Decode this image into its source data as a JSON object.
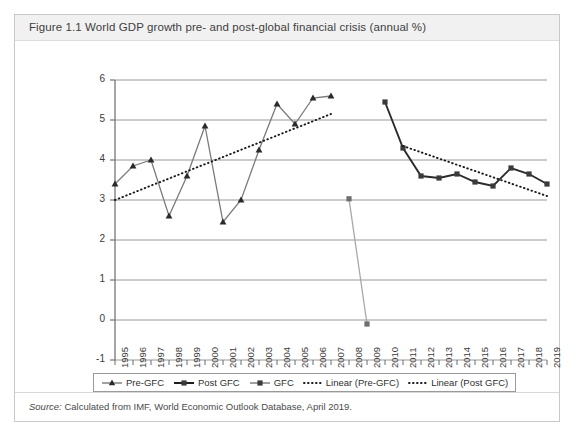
{
  "figure": {
    "title": "Figure 1.1  World GDP growth pre- and post-global financial crisis (annual %)",
    "source_label": "Source:",
    "source_text": "Calculated from IMF, World Economic Outlook Database, April 2019."
  },
  "legend": {
    "items": [
      {
        "label": "Pre-GFC",
        "marker": "triangle-marker",
        "style": "solid"
      },
      {
        "label": "Post GFC",
        "marker": "square-marker",
        "style": "solid"
      },
      {
        "label": "GFC",
        "marker": "square-marker",
        "style": "solid"
      },
      {
        "label": "Linear (Pre-GFC)",
        "marker": "dotted-line",
        "style": "dotted"
      },
      {
        "label": "Linear (Post GFC)",
        "marker": "dotted-line",
        "style": "dotted"
      }
    ]
  },
  "colors": {
    "series_pre_gfc": "#7a7a7a",
    "series_post_gfc": "#2b2b2b",
    "series_gfc": "#a8a8a8",
    "trend": "#1a1a1a",
    "gridline": "#8c8c8c",
    "axis": "#6b6b6b",
    "card_border": "#c9c9c9",
    "header_bg": "#f1f1f1"
  },
  "chart_data": {
    "type": "line",
    "title": "World GDP growth pre- and post-global financial crisis (annual %)",
    "xlabel": "",
    "ylabel": "",
    "ylim": [
      -1,
      6
    ],
    "yticks": [
      -1,
      0,
      1,
      2,
      3,
      4,
      5,
      6
    ],
    "grid": true,
    "legend_position": "bottom",
    "x": [
      1995,
      1996,
      1997,
      1998,
      1999,
      2000,
      2001,
      2002,
      2003,
      2004,
      2005,
      2006,
      2007,
      2008,
      2009,
      2010,
      2011,
      2012,
      2013,
      2014,
      2015,
      2016,
      2017,
      2018,
      2019
    ],
    "categories": [
      "1995",
      "1996",
      "1997",
      "1998",
      "1999",
      "2000",
      "2001",
      "2002",
      "2003",
      "2004",
      "2005",
      "2006",
      "2007",
      "2008",
      "2009",
      "2010",
      "2011",
      "2012",
      "2013",
      "2014",
      "2015",
      "2016",
      "2017",
      "2018",
      "2019"
    ],
    "series": [
      {
        "name": "Pre-GFC",
        "marker": "triangle",
        "color": "#7a7a7a",
        "points": [
          {
            "x": 1995,
            "y": 3.4
          },
          {
            "x": 1996,
            "y": 3.85
          },
          {
            "x": 1997,
            "y": 4.0
          },
          {
            "x": 1998,
            "y": 2.6
          },
          {
            "x": 1999,
            "y": 3.6
          },
          {
            "x": 2000,
            "y": 4.85
          },
          {
            "x": 2001,
            "y": 2.45
          },
          {
            "x": 2002,
            "y": 3.0
          },
          {
            "x": 2003,
            "y": 4.25
          },
          {
            "x": 2004,
            "y": 5.4
          },
          {
            "x": 2005,
            "y": 4.9
          },
          {
            "x": 2006,
            "y": 5.55
          },
          {
            "x": 2007,
            "y": 5.6
          }
        ]
      },
      {
        "name": "GFC",
        "marker": "square",
        "color": "#a8a8a8",
        "points": [
          {
            "x": 2008,
            "y": 3.03
          },
          {
            "x": 2009,
            "y": -0.1
          }
        ]
      },
      {
        "name": "Post GFC",
        "marker": "square",
        "color": "#2b2b2b",
        "points": [
          {
            "x": 2010,
            "y": 5.45
          },
          {
            "x": 2011,
            "y": 4.3
          },
          {
            "x": 2012,
            "y": 3.6
          },
          {
            "x": 2013,
            "y": 3.55
          },
          {
            "x": 2014,
            "y": 3.65
          },
          {
            "x": 2015,
            "y": 3.45
          },
          {
            "x": 2016,
            "y": 3.35
          },
          {
            "x": 2017,
            "y": 3.8
          },
          {
            "x": 2018,
            "y": 3.65
          },
          {
            "x": 2019,
            "y": 3.4
          }
        ]
      }
    ],
    "trendlines": [
      {
        "name": "Linear (Pre-GFC)",
        "style": "dotted",
        "color": "#1a1a1a",
        "from": {
          "x": 1995,
          "y": 3.0
        },
        "to": {
          "x": 2007,
          "y": 5.15
        }
      },
      {
        "name": "Linear (Post GFC)",
        "style": "dotted",
        "color": "#1a1a1a",
        "from": {
          "x": 2011,
          "y": 4.35
        },
        "to": {
          "x": 2019,
          "y": 3.1
        }
      }
    ]
  }
}
